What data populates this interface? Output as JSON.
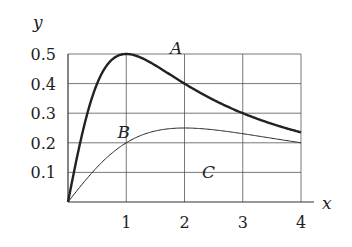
{
  "chart_data": {
    "type": "line",
    "title": "",
    "xlabel": "x",
    "ylabel": "y",
    "xlim": [
      0,
      4
    ],
    "ylim": [
      0,
      0.5
    ],
    "x_ticks": [
      "1",
      "2",
      "3",
      "4"
    ],
    "y_ticks": [
      "0.1",
      "0.2",
      "0.3",
      "0.4",
      "0.5"
    ],
    "grid": true,
    "legend": "none (inline curve labels)",
    "series": [
      {
        "name": "A",
        "style": "thick",
        "x": [
          0,
          0.5,
          1,
          1.5,
          2,
          2.5,
          3,
          3.5,
          4
        ],
        "values": [
          0,
          0.4,
          0.5,
          0.46,
          0.4,
          0.34,
          0.3,
          0.27,
          0.235
        ]
      },
      {
        "name": "B",
        "style": "thin",
        "x": [
          0,
          0.5,
          1,
          1.5,
          2,
          2.5,
          3,
          3.5,
          4
        ],
        "values": [
          0,
          0.118,
          0.2,
          0.24,
          0.25,
          0.244,
          0.231,
          0.215,
          0.2
        ]
      }
    ],
    "annotations": [
      {
        "text": "A",
        "x": 1.75,
        "y": 0.52
      },
      {
        "text": "B",
        "x": 0.85,
        "y": 0.235
      },
      {
        "text": "C",
        "x": 2.3,
        "y": 0.1
      }
    ]
  }
}
